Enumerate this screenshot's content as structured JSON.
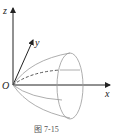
{
  "figure": {
    "axes": {
      "x": "x",
      "y": "y",
      "z": "z",
      "origin": "O"
    },
    "caption": "图 7-15",
    "colors": {
      "axis": "#222222",
      "surface": "#999999",
      "dashed": "#444444"
    }
  }
}
